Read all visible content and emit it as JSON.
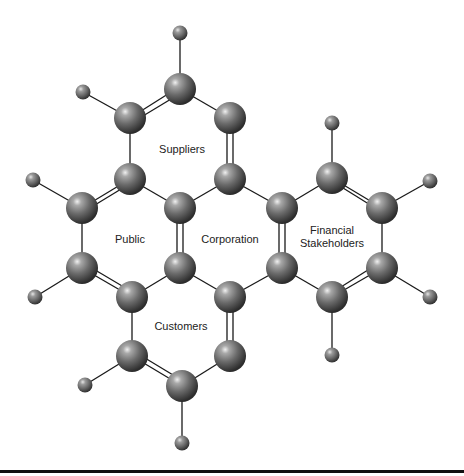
{
  "diagram": {
    "type": "molecule-metaphor",
    "labels": {
      "suppliers": "Suppliers",
      "public": "Public",
      "corporation": "Corporation",
      "financial_line1": "Financial",
      "financial_line2": "Stakeholders",
      "customers": "Customers"
    },
    "colors": {
      "atom": "#6b6b6b",
      "atom_highlight": "#e8e8e8",
      "atom_shadow": "#2a2a2a",
      "bond": "#1a1a1a",
      "text": "#222222",
      "rule": "#111111"
    }
  }
}
